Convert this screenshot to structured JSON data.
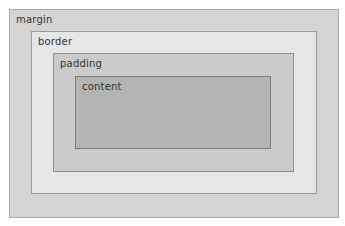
{
  "diagram": {
    "layers": [
      {
        "name": "margin",
        "label": "margin",
        "color": "#d4d4d4"
      },
      {
        "name": "border",
        "label": "border",
        "color": "#e6e6e6"
      },
      {
        "name": "padding",
        "label": "padding",
        "color": "#cbcbcb"
      },
      {
        "name": "content",
        "label": "content",
        "color": "#b4b4b4"
      }
    ]
  }
}
